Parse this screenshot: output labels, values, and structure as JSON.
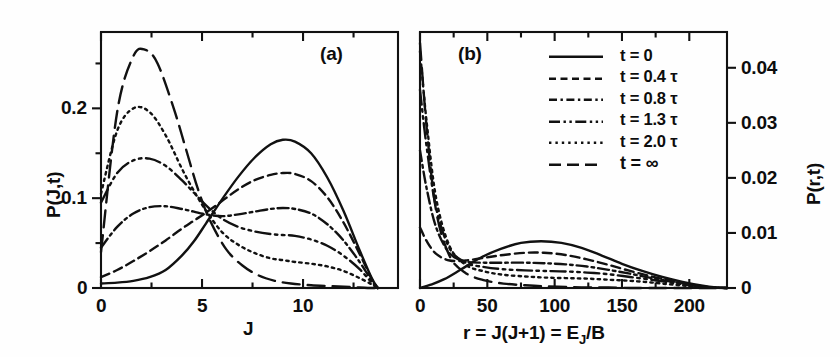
{
  "figure": {
    "panel_a_label": "(a)",
    "panel_b_label": "(b)"
  },
  "legend": {
    "entries": [
      {
        "label": "t = 0",
        "style": "solid"
      },
      {
        "label": "t = 0.4 τ",
        "style": "dashed"
      },
      {
        "label": "t = 0.8 τ",
        "style": "dashdot"
      },
      {
        "label": "t = 1.3 τ",
        "style": "dashdotdot"
      },
      {
        "label": "t = 2.0 τ",
        "style": "dotted"
      },
      {
        "label": "t = ∞",
        "style": "longdash"
      }
    ]
  },
  "chart_data": [
    {
      "type": "line",
      "panel": "(a)",
      "title": "",
      "xlabel": "J",
      "ylabel": "P(J,t)",
      "xlim": [
        0,
        14.7
      ],
      "ylim": [
        0,
        0.285
      ],
      "xticks": [
        0,
        5,
        10
      ],
      "xtick_labels": [
        "0",
        "5",
        "10"
      ],
      "xminor": [
        2.5,
        7.5,
        12.5
      ],
      "yticks": [
        0,
        0.1,
        0.2
      ],
      "ytick_labels": [
        "0",
        "0.1",
        "0.2"
      ],
      "yminor": [
        0.05,
        0.15,
        0.25
      ],
      "grid": false,
      "legend_position": "panel-b-upper-center",
      "series": [
        {
          "name": "t = 0",
          "style": "solid",
          "x": [
            0,
            0.8,
            1.6,
            2.4,
            3.2,
            4.0,
            4.6,
            5.2,
            6.0,
            6.8,
            7.6,
            8.4,
            9.0,
            9.6,
            10.4,
            11.2,
            12.0,
            12.8,
            13.4,
            13.7
          ],
          "y": [
            0.005,
            0.006,
            0.008,
            0.012,
            0.02,
            0.036,
            0.052,
            0.072,
            0.099,
            0.124,
            0.145,
            0.16,
            0.165,
            0.163,
            0.15,
            0.123,
            0.086,
            0.042,
            0.011,
            0.0
          ]
        },
        {
          "name": "t = 0.4 tau",
          "style": "dashed",
          "x": [
            0,
            0.8,
            1.6,
            2.4,
            3.2,
            4.0,
            4.6,
            5.2,
            6.0,
            6.8,
            7.6,
            8.4,
            9.0,
            9.6,
            10.4,
            11.2,
            12.0,
            12.8,
            13.4,
            13.7
          ],
          "y": [
            0.012,
            0.02,
            0.03,
            0.041,
            0.053,
            0.066,
            0.075,
            0.084,
            0.097,
            0.11,
            0.12,
            0.126,
            0.128,
            0.127,
            0.119,
            0.101,
            0.073,
            0.038,
            0.01,
            0.0
          ]
        },
        {
          "name": "t = 0.8 tau",
          "style": "dashdot",
          "x": [
            0,
            0.8,
            1.6,
            2.4,
            3.2,
            4.0,
            4.6,
            5.2,
            6.0,
            6.8,
            7.6,
            8.4,
            9.0,
            9.6,
            10.4,
            11.2,
            12.0,
            12.8,
            13.4,
            13.7
          ],
          "y": [
            0.045,
            0.068,
            0.083,
            0.09,
            0.091,
            0.088,
            0.085,
            0.082,
            0.08,
            0.082,
            0.085,
            0.088,
            0.089,
            0.088,
            0.083,
            0.071,
            0.053,
            0.029,
            0.008,
            0.0
          ]
        },
        {
          "name": "t = 1.3 tau",
          "style": "dashdotdot",
          "x": [
            0,
            0.8,
            1.6,
            2.4,
            3.2,
            4.0,
            4.6,
            5.2,
            6.0,
            6.8,
            7.6,
            8.4,
            9.0,
            9.6,
            10.4,
            11.2,
            12.0,
            12.8,
            13.4,
            13.7
          ],
          "y": [
            0.095,
            0.128,
            0.142,
            0.144,
            0.136,
            0.12,
            0.106,
            0.092,
            0.077,
            0.068,
            0.063,
            0.06,
            0.059,
            0.058,
            0.054,
            0.047,
            0.036,
            0.021,
            0.006,
            0.0
          ]
        },
        {
          "name": "t = 2.0 tau",
          "style": "dotted",
          "x": [
            0,
            0.8,
            1.6,
            2.4,
            3.2,
            4.0,
            4.6,
            5.2,
            6.0,
            6.8,
            7.6,
            8.4,
            9.0,
            9.6,
            10.4,
            11.2,
            12.0,
            12.8,
            13.4,
            13.7
          ],
          "y": [
            0.105,
            0.175,
            0.2,
            0.196,
            0.17,
            0.133,
            0.108,
            0.086,
            0.062,
            0.048,
            0.039,
            0.033,
            0.031,
            0.029,
            0.027,
            0.024,
            0.019,
            0.011,
            0.004,
            0.0
          ]
        },
        {
          "name": "t = infinity",
          "style": "longdash",
          "x": [
            0,
            0.8,
            1.6,
            2.2,
            2.8,
            3.6,
            4.2,
            4.8,
            5.4,
            6.2,
            7.0,
            7.8,
            8.6,
            9.4,
            10.4,
            11.4,
            12.4,
            13.2,
            13.7
          ],
          "y": [
            0.04,
            0.196,
            0.258,
            0.265,
            0.25,
            0.2,
            0.155,
            0.11,
            0.075,
            0.043,
            0.025,
            0.014,
            0.008,
            0.005,
            0.003,
            0.002,
            0.001,
            0.0,
            0.0
          ]
        }
      ]
    },
    {
      "type": "line",
      "panel": "(b)",
      "title": "",
      "xlabel": "r = J(J+1) = Eⱼ/B",
      "ylabel": "P(r,t)",
      "xlim": [
        0,
        228
      ],
      "ylim": [
        0,
        0.0465
      ],
      "xticks": [
        0,
        50,
        100,
        150,
        200
      ],
      "xtick_labels": [
        "0",
        "50",
        "100",
        "150",
        "200"
      ],
      "xminor": [
        25,
        75,
        125,
        175
      ],
      "yticks": [
        0,
        0.01,
        0.02,
        0.03,
        0.04
      ],
      "ytick_labels": [
        "0",
        "0.01",
        "0.02",
        "0.03",
        "0.04"
      ],
      "grid": false,
      "series": [
        {
          "name": "t = 0",
          "style": "solid",
          "x": [
            0,
            8,
            18,
            30,
            45,
            60,
            75,
            90,
            105,
            120,
            135,
            150,
            165,
            180,
            195,
            210,
            220,
            228
          ],
          "y": [
            0.0,
            0.0006,
            0.0016,
            0.0033,
            0.0055,
            0.0071,
            0.0082,
            0.0085,
            0.0082,
            0.0073,
            0.0059,
            0.0044,
            0.0031,
            0.002,
            0.0011,
            0.0004,
            0.0001,
            0.0
          ]
        },
        {
          "name": "t = 0.4 tau",
          "style": "dashed",
          "x": [
            0,
            5,
            12,
            22,
            34,
            48,
            62,
            78,
            92,
            108,
            124,
            140,
            156,
            172,
            188,
            204,
            216,
            228
          ],
          "y": [
            0.011,
            0.0085,
            0.0062,
            0.005,
            0.005,
            0.0055,
            0.006,
            0.0064,
            0.0064,
            0.006,
            0.0052,
            0.0042,
            0.0031,
            0.0021,
            0.0012,
            0.0005,
            0.0001,
            0.0
          ]
        },
        {
          "name": "t = 0.8 tau",
          "style": "dashdot",
          "x": [
            0,
            5,
            12,
            22,
            34,
            48,
            62,
            78,
            92,
            108,
            124,
            140,
            156,
            172,
            188,
            204,
            216,
            228
          ],
          "y": [
            0.025,
            0.018,
            0.011,
            0.0063,
            0.0048,
            0.0046,
            0.0046,
            0.0046,
            0.0045,
            0.0043,
            0.0039,
            0.0033,
            0.0026,
            0.0018,
            0.0011,
            0.0005,
            0.0001,
            0.0
          ]
        },
        {
          "name": "t = 1.3 tau",
          "style": "dashdotdot",
          "x": [
            0,
            5,
            12,
            22,
            34,
            48,
            62,
            78,
            92,
            108,
            124,
            140,
            156,
            172,
            188,
            204,
            216,
            228
          ],
          "y": [
            0.036,
            0.0255,
            0.0145,
            0.0072,
            0.0046,
            0.0038,
            0.0034,
            0.0032,
            0.0031,
            0.003,
            0.0028,
            0.0025,
            0.002,
            0.0015,
            0.0009,
            0.0004,
            0.0001,
            0.0
          ]
        },
        {
          "name": "t = 2.0 tau",
          "style": "dotted",
          "x": [
            0,
            5,
            12,
            22,
            34,
            48,
            62,
            78,
            92,
            108,
            124,
            140,
            156,
            172,
            188,
            204,
            216,
            228
          ],
          "y": [
            0.043,
            0.03,
            0.0163,
            0.0076,
            0.0042,
            0.003,
            0.0024,
            0.0021,
            0.0019,
            0.0018,
            0.0017,
            0.0015,
            0.0013,
            0.001,
            0.0006,
            0.0003,
            0.0001,
            0.0
          ]
        },
        {
          "name": "t = infinity",
          "style": "longdash",
          "x": [
            0,
            5,
            12,
            22,
            34,
            48,
            62,
            78,
            92,
            108,
            124,
            140,
            156,
            172,
            188,
            204,
            216,
            228
          ],
          "y": [
            0.0445,
            0.029,
            0.014,
            0.0058,
            0.0027,
            0.0014,
            0.0008,
            0.0005,
            0.0003,
            0.0002,
            0.0001,
            0.0001,
            0.0,
            0.0,
            0.0,
            0.0,
            0.0,
            0.0
          ]
        }
      ]
    }
  ]
}
